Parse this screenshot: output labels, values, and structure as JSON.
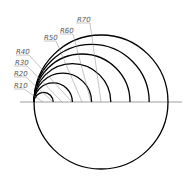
{
  "diagram": {
    "type": "tangent-circles-radius-dimensions",
    "tangent_point": {
      "x": 34,
      "y": 102
    },
    "centerline_y": 102,
    "scale_px_per_unit": 0.96,
    "stroke_color": "#000000",
    "leader_color": "#888888",
    "arcs": [
      {
        "label": "R10",
        "radius": 10
      },
      {
        "label": "R20",
        "radius": 20
      },
      {
        "label": "R30",
        "radius": 30
      },
      {
        "label": "R40",
        "radius": 40
      },
      {
        "label": "R50",
        "radius": 50
      },
      {
        "label": "R60",
        "radius": 60
      },
      {
        "label": "R70",
        "radius": 70,
        "full_circle": true
      }
    ],
    "labels": {
      "r10": "R10",
      "r20": "R20",
      "r30": "R30",
      "r40": "R40",
      "r50": "R50",
      "r60": "R60",
      "r70": "R70"
    }
  }
}
